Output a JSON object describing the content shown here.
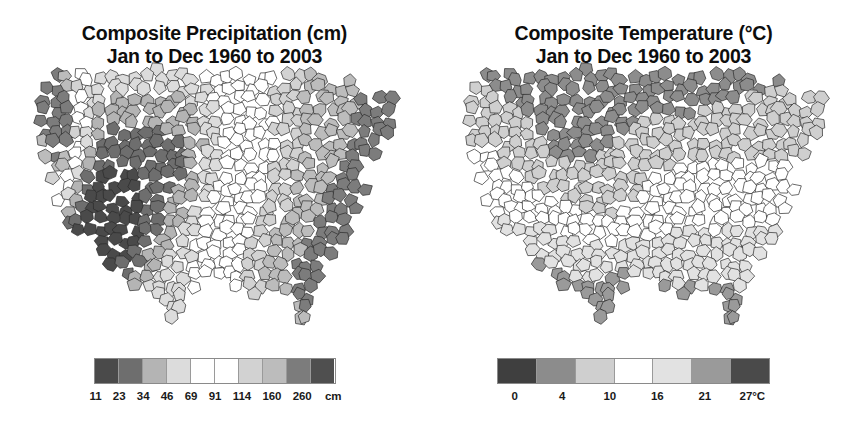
{
  "background": "#ffffff",
  "panels": [
    {
      "key": "precipitation",
      "title_line1": "Composite Precipitation (cm)",
      "title_line2": "Jan to Dec 1960 to 2003",
      "legend": {
        "unit": "cm",
        "tick_labels": [
          "11",
          "23",
          "34",
          "46",
          "69",
          "91",
          "114",
          "160",
          "260"
        ],
        "swatch_colors": [
          "#4a4a4a",
          "#6e6e6e",
          "#b4b4b4",
          "#dcdcdc",
          "#ffffff",
          "#ffffff",
          "#d2d2d2",
          "#bcbcbc",
          "#7c7c7c",
          "#4f4f4f"
        ]
      }
    },
    {
      "key": "temperature",
      "title_line1": "Composite Temperature (°C)",
      "title_line2": "Jan to Dec 1960 to 2003",
      "legend": {
        "unit": "°C",
        "tick_labels": [
          "0",
          "4",
          "10",
          "16",
          "21",
          "27°C"
        ],
        "swatch_colors": [
          "#3f3f3f",
          "#8c8c8c",
          "#cfcfcf",
          "#ffffff",
          "#e2e2e2",
          "#9a9a9a",
          "#4a4a4a"
        ]
      }
    }
  ],
  "chart_data": {
    "type": "heatmap",
    "subtype": "choropleth-map-pair",
    "region": "Contiguous United States (climate divisions / counties)",
    "period": {
      "months": "Jan to Dec",
      "year_start": 1960,
      "year_end": 2003
    },
    "grid": false,
    "legend_position": "bottom",
    "maps": [
      {
        "name": "Composite Precipitation (cm)",
        "variable": "precipitation",
        "unit": "cm",
        "class_breaks": [
          11,
          23,
          34,
          46,
          69,
          91,
          114,
          160,
          260
        ],
        "n_classes": 10,
        "palette": [
          "#4a4a4a",
          "#6e6e6e",
          "#b4b4b4",
          "#dcdcdc",
          "#ffffff",
          "#ffffff",
          "#d2d2d2",
          "#bcbcbc",
          "#7c7c7c",
          "#4f4f4f"
        ],
        "regional_readings": [
          {
            "region": "Pacific Northwest coast (WA/OR)",
            "class_index": 9,
            "value_range": "160-260",
            "shade": "#4f4f4f"
          },
          {
            "region": "Northern California coast",
            "class_index": 8,
            "value_range": "114-160",
            "shade": "#7c7c7c"
          },
          {
            "region": "Nevada / Great Basin",
            "class_index": 1,
            "value_range": "11-23",
            "shade": "#6e6e6e"
          },
          {
            "region": "Arizona / Mojave desert",
            "class_index": 0,
            "value_range": "below 11",
            "shade": "#4a4a4a"
          },
          {
            "region": "Central Great Plains (KS/NE)",
            "class_index": 4,
            "value_range": "46-69",
            "shade": "#ffffff"
          },
          {
            "region": "Midwest (IA/IL/MO)",
            "class_index": 5,
            "value_range": "69-91",
            "shade": "#ffffff"
          },
          {
            "region": "Gulf Coast / Deep South",
            "class_index": 7,
            "value_range": "114-160",
            "shade": "#bcbcbc"
          },
          {
            "region": "Southern Appalachians",
            "class_index": 7,
            "value_range": "114-160",
            "shade": "#bcbcbc"
          },
          {
            "region": "Northeast / New England",
            "class_index": 6,
            "value_range": "91-114",
            "shade": "#d2d2d2"
          },
          {
            "region": "Florida peninsula",
            "class_index": 7,
            "value_range": "114-160",
            "shade": "#bcbcbc"
          }
        ]
      },
      {
        "name": "Composite Temperature (°C)",
        "variable": "temperature",
        "unit": "°C",
        "class_breaks": [
          0,
          4,
          10,
          16,
          21,
          27
        ],
        "n_classes": 7,
        "palette": [
          "#3f3f3f",
          "#8c8c8c",
          "#cfcfcf",
          "#ffffff",
          "#e2e2e2",
          "#9a9a9a",
          "#4a4a4a"
        ],
        "regional_readings": [
          {
            "region": "Northern Minnesota / North Dakota",
            "class_index": 1,
            "value_range": "0-4",
            "shade": "#8c8c8c"
          },
          {
            "region": "Northern Rockies (ID/MT)",
            "class_index": 1,
            "value_range": "0-4",
            "shade": "#8c8c8c"
          },
          {
            "region": "Colorado high country",
            "class_index": 1,
            "value_range": "0-4",
            "shade": "#8c8c8c"
          },
          {
            "region": "Upper Midwest / Great Lakes",
            "class_index": 2,
            "value_range": "4-10",
            "shade": "#cfcfcf"
          },
          {
            "region": "Pacific Northwest interior",
            "class_index": 2,
            "value_range": "4-10",
            "shade": "#cfcfcf"
          },
          {
            "region": "Central Plains / Ohio Valley",
            "class_index": 3,
            "value_range": "10-16",
            "shade": "#ffffff"
          },
          {
            "region": "Mid-Atlantic / Northeast coast",
            "class_index": 3,
            "value_range": "10-16",
            "shade": "#ffffff"
          },
          {
            "region": "Southeast / Deep South",
            "class_index": 4,
            "value_range": "16-21",
            "shade": "#e2e2e2"
          },
          {
            "region": "Desert Southwest (AZ/CA)",
            "class_index": 4,
            "value_range": "16-21",
            "shade": "#e2e2e2"
          },
          {
            "region": "South Texas",
            "class_index": 5,
            "value_range": "21-27",
            "shade": "#9a9a9a"
          },
          {
            "region": "South Florida",
            "class_index": 5,
            "value_range": "21-27",
            "shade": "#9a9a9a"
          }
        ]
      }
    ]
  }
}
